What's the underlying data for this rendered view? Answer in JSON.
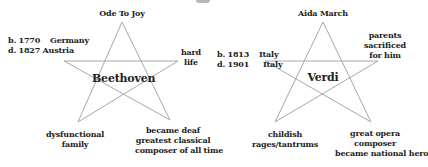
{
  "diagram": {
    "type": "pentagram-comparison",
    "line_color": "#a8a8a8",
    "stars": [
      {
        "name": "Beethoven",
        "top": "Ode To Joy",
        "left": [
          "b. 1770",
          "Germany",
          "d. 1827 Austria"
        ],
        "right": [
          "hard",
          "life"
        ],
        "bottom_left": [
          "dysfunctional",
          "family"
        ],
        "bottom_right": [
          "became deaf",
          "greatest classical",
          "composer of all time"
        ]
      },
      {
        "name": "Verdi",
        "top": "Aida March",
        "left": [
          "b. 1813",
          "Italy",
          "d. 1901",
          "Italy"
        ],
        "right": [
          "parents",
          "sacrificed",
          "for him"
        ],
        "bottom_left": [
          "childish",
          "rages/tantrums"
        ],
        "bottom_right": [
          "great opera",
          "composer",
          "became national hero"
        ]
      }
    ]
  }
}
